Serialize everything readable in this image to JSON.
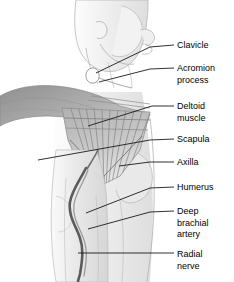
{
  "figure": {
    "view": "right lateral profile, head facing right",
    "style": "grayscale medical illustration",
    "background_color": "#ffffff",
    "label_text_color": "#000000",
    "leader_line_color": "#1a1a1a",
    "width": 234,
    "height": 282
  },
  "labels": [
    {
      "id": "clavicle",
      "text": "Clavicle",
      "x": 177,
      "y": 40,
      "leader": "M174,45 L150,47 L96,73"
    },
    {
      "id": "acromion",
      "text": "Acromion\nprocess",
      "x": 177,
      "y": 63,
      "leader": "M174,68 L150,69 L99,82"
    },
    {
      "id": "deltoid",
      "text": "Deltoid\nmuscle",
      "x": 177,
      "y": 101,
      "leader": "M174,106 L152,106 L88,126"
    },
    {
      "id": "scapula",
      "text": "Scapula",
      "x": 177,
      "y": 134,
      "leader": "M174,139 L150,140 L38,160"
    },
    {
      "id": "axilla",
      "text": "Axilla",
      "x": 177,
      "y": 157,
      "leader": "M174,162 L150,162 L119,166"
    },
    {
      "id": "humerus",
      "text": "Humerus",
      "x": 177,
      "y": 182,
      "leader": "M174,187 L150,188 L86,213"
    },
    {
      "id": "deep-brachial",
      "text": "Deep\nbrachial\nartery",
      "x": 177,
      "y": 206,
      "leader": "M174,211 L150,212 L88,229"
    },
    {
      "id": "radial-nerve",
      "text": "Radial\nnerve",
      "x": 177,
      "y": 249,
      "leader": "M174,253 L78,253"
    }
  ],
  "structures": [
    {
      "id": "head-neck",
      "name": "Head and neck in profile"
    },
    {
      "id": "ear",
      "name": "Ear"
    },
    {
      "id": "jaw-chin",
      "name": "Jaw and chin"
    },
    {
      "id": "clavicle-bone",
      "name": "Clavicle bone highlight"
    },
    {
      "id": "deltoid-muscle",
      "name": "Deltoid muscle with striations"
    },
    {
      "id": "shoulder-mass",
      "name": "Shoulder and trapezius mass"
    },
    {
      "id": "torso",
      "name": "Torso and chest contour"
    },
    {
      "id": "upper-arm",
      "name": "Upper arm"
    },
    {
      "id": "brachial-artery",
      "name": "Deep brachial artery vessel"
    },
    {
      "id": "radial-nerve-line",
      "name": "Radial nerve"
    }
  ],
  "palette": {
    "shoulder_gray": "#a6a6a6",
    "deltoid_gray": "#b9b9b9",
    "skin_light": "#f2f2f2",
    "skin_mid": "#e2e2e2",
    "outline": "#9a9a9a",
    "vessel_dark": "#5b5b5b",
    "clavicle_light": "#fbfbfb"
  }
}
